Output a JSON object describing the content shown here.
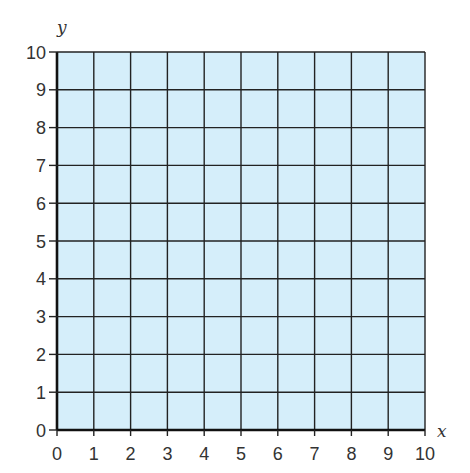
{
  "chart_data": {
    "type": "grid",
    "title": "",
    "xlabel": "x",
    "ylabel": "y",
    "xlim": [
      0,
      10
    ],
    "ylim": [
      0,
      10
    ],
    "x_ticks": [
      "0",
      "1",
      "2",
      "3",
      "4",
      "5",
      "6",
      "7",
      "8",
      "9",
      "10"
    ],
    "y_ticks": [
      "0",
      "1",
      "2",
      "3",
      "4",
      "5",
      "6",
      "7",
      "8",
      "9",
      "10"
    ],
    "grid": true,
    "series": []
  },
  "colors": {
    "fill": "#d5eefa",
    "grid_line": "#222222",
    "axis": "#111111",
    "text": "#333333"
  },
  "labels": {
    "x_axis": "x",
    "y_axis": "y"
  }
}
